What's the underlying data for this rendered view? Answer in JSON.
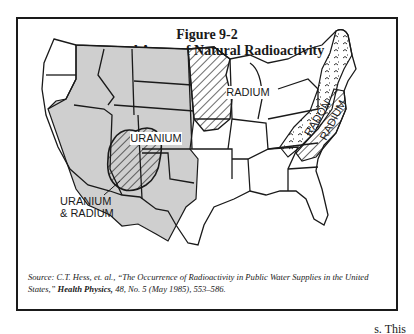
{
  "figure": {
    "number": "Figure 9-2",
    "title": "General Areas of Natural Radioactivity"
  },
  "map": {
    "colors": {
      "uranium_fill": "#cfcfcf",
      "outline": "#1a1a1a",
      "background": "#ffffff"
    },
    "regions": [
      {
        "label": "URANIUM",
        "pattern": "gray-fill",
        "area": "Mountain West / Great Plains"
      },
      {
        "label": "RADIUM",
        "pattern": "diagonal-hatch",
        "area": "Upper Midwest (MN, IA, WI, IL)"
      },
      {
        "label": "URANIUM & RADIUM",
        "pattern": "diagonal-hatch-over-gray",
        "area": "Four Corners (UT, AZ, CO, NM)"
      },
      {
        "label": "RADON",
        "pattern": "wavy-dash",
        "area": "Appalachians / New England"
      },
      {
        "label": "RADIUM",
        "pattern": "diagonal-hatch",
        "area": "Appalachian Piedmont"
      }
    ],
    "labels": {
      "uranium": "URANIUM",
      "radium_midwest": "RADIUM",
      "uranium_radium_line1": "URANIUM",
      "uranium_radium_line2": "& RADIUM",
      "radon": "RADON",
      "radium_east": "RADIUM"
    }
  },
  "source": {
    "prefix": "Source: C.T. Hess, et. al., “The Occurrence of Radioactivity in Public Water Supplies in the United States,” ",
    "journal": "Health Physics,",
    "suffix": " 48, No. 5 (May 1985), 553–586."
  },
  "page_fragment": "s. This"
}
